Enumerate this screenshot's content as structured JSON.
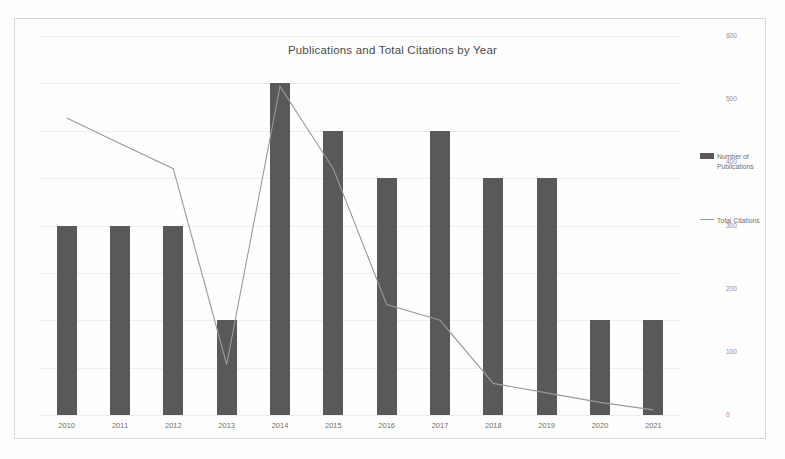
{
  "chart_data": {
    "type": "bar",
    "title": "Publications and Total Citations by Year",
    "xlabel": "",
    "ylabel": "",
    "categories": [
      "2010",
      "2011",
      "2012",
      "2013",
      "2014",
      "2015",
      "2016",
      "2017",
      "2018",
      "2019",
      "2020",
      "2021"
    ],
    "series": [
      {
        "name": "Number of Publications",
        "type": "bar",
        "axis": "left",
        "color": "#595959",
        "values": [
          4,
          4,
          4,
          2,
          7,
          6,
          5,
          6,
          5,
          5,
          2,
          2
        ]
      },
      {
        "name": "Total Citations",
        "type": "line",
        "axis": "right",
        "color": "#9a9a9a",
        "values": [
          470,
          430,
          390,
          80,
          520,
          390,
          175,
          150,
          50,
          35,
          20,
          8
        ]
      }
    ],
    "left_axis": {
      "ticks": [
        "0",
        "1",
        "2",
        "3",
        "4",
        "5",
        "6",
        "7",
        "8"
      ],
      "ylim": [
        0,
        8
      ]
    },
    "right_axis": {
      "ticks": [
        "0",
        "100",
        "200",
        "300",
        "400",
        "500",
        "600"
      ],
      "ylim": [
        0,
        600
      ]
    },
    "grid": true,
    "legend_position": "right",
    "legend": [
      {
        "label_line1": "Number of",
        "label_line2": "Publications",
        "marker": "bar-swatch"
      },
      {
        "label_line1": "Total",
        "label_line2": "Citations",
        "marker": "line-swatch"
      }
    ]
  }
}
